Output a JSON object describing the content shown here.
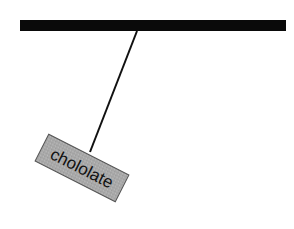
{
  "diagram": {
    "title": "",
    "hanging_label": "chololate",
    "colors": {
      "bar": "#0a0a0a",
      "string": "#111111",
      "box_fill": "#a9a9a9",
      "box_stroke": "#555555"
    }
  }
}
